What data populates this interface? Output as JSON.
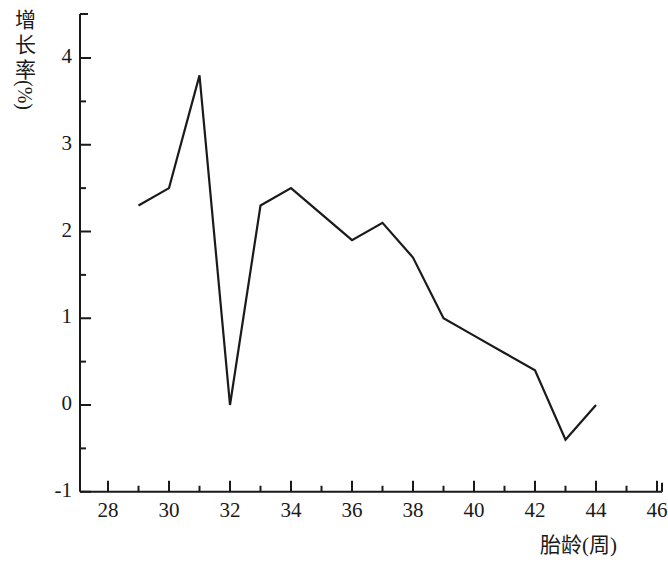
{
  "chart_data": {
    "type": "line",
    "title": "",
    "xlabel": "胎龄(周)",
    "ylabel": "增长率(%)",
    "ylabel_chars": [
      "增",
      "长",
      "率"
    ],
    "ylabel_unit": "(%)",
    "x": [
      29,
      30,
      31,
      32,
      33,
      34,
      35,
      36,
      37,
      38,
      39,
      40,
      41,
      42,
      43,
      44
    ],
    "values": [
      2.3,
      2.5,
      3.8,
      0.0,
      2.3,
      2.5,
      2.2,
      1.9,
      2.1,
      1.7,
      1.0,
      0.8,
      0.6,
      0.4,
      -0.4,
      0.0
    ],
    "series": [
      {
        "name": "增长率",
        "values": [
          2.3,
          2.5,
          3.8,
          0.0,
          2.3,
          2.5,
          2.2,
          1.9,
          2.1,
          1.7,
          1.0,
          0.8,
          0.6,
          0.4,
          -0.4,
          0.0
        ]
      }
    ],
    "xlim": [
      27,
      46
    ],
    "ylim": [
      -1,
      4.4
    ],
    "xticks": [
      28,
      30,
      32,
      34,
      36,
      38,
      40,
      42,
      44,
      46
    ],
    "xtick_labels": [
      "28",
      "30",
      "32",
      "34",
      "36",
      "38",
      "40",
      "42",
      "44",
      "46"
    ],
    "xminor_ticks": [
      29,
      31,
      33,
      35,
      37,
      39,
      41,
      43,
      45
    ],
    "yticks": [
      -1,
      0,
      1,
      2,
      3,
      4
    ],
    "ytick_labels": [
      "-1",
      "0",
      "1",
      "2",
      "3",
      "4"
    ],
    "yminor_ticks": [
      -0.5,
      0.5,
      1.5,
      2.5,
      3.5
    ],
    "grid": false,
    "legend": false,
    "line_color": "#1a1a1a",
    "axis_color": "#1a1a1a",
    "background_color": "#ffffff",
    "markers": false
  }
}
